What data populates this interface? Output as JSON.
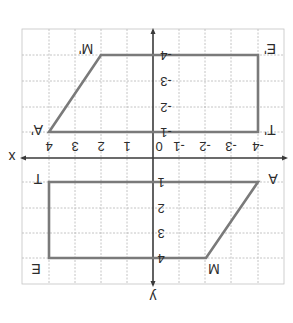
{
  "figure": {
    "orientation": "rotated 180 degrees",
    "axes": {
      "x_label": "x",
      "y_label": "y",
      "x_ticks": [
        "-4",
        "-3",
        "-2",
        "-1",
        "0",
        "1",
        "2",
        "3",
        "4"
      ],
      "y_ticks_upper": [
        "-1",
        "-2",
        "-3",
        "-4"
      ],
      "y_ticks_lower": [
        "1",
        "2",
        "3",
        "4"
      ]
    },
    "shapes": [
      {
        "name": "AMET",
        "vertices": [
          {
            "label": "A",
            "x": -4,
            "y": 1
          },
          {
            "label": "M",
            "x": -2,
            "y": 4
          },
          {
            "label": "E",
            "x": 4,
            "y": 4
          },
          {
            "label": "T",
            "x": 4,
            "y": 1
          }
        ]
      },
      {
        "name": "A'M'E'T'",
        "vertices": [
          {
            "label": "A'",
            "x": 4,
            "y": -1
          },
          {
            "label": "M'",
            "x": 2,
            "y": -4
          },
          {
            "label": "E'",
            "x": -4,
            "y": -4
          },
          {
            "label": "T'",
            "x": -4,
            "y": -1
          }
        ]
      }
    ],
    "colors": {
      "shape_stroke": "#7a7a7a",
      "axis": "#3a3a3a",
      "grid": "#b5b5b5",
      "text": "#2b2b2b"
    }
  }
}
